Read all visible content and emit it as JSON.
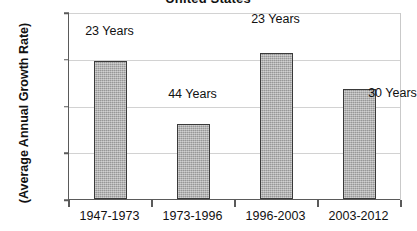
{
  "chart_data": {
    "type": "bar",
    "title": "United States",
    "xlabel": "",
    "ylabel": "(Average Annual Growth Rate)",
    "categories": [
      "1947-1973",
      "1973-1996",
      "1996-2003",
      "2003-2012"
    ],
    "values": [
      2.95,
      1.6,
      3.13,
      2.35
    ],
    "point_labels": [
      "23 Years",
      "44 Years",
      "23 Years",
      "30 Years"
    ],
    "ylim": [
      0,
      4
    ],
    "ytick_labels": [
      "0.0%",
      "1.0%",
      "2.0%",
      "3.0%",
      "4.0%"
    ],
    "ytick_values": [
      0,
      1,
      2,
      3,
      4
    ],
    "grid": true,
    "legend": "none",
    "bar_color": "#a9a9a9",
    "bar_border_color": "#3a3a3a",
    "gridline_color": "#d2d2d2",
    "axis_color": "#5a5a5a",
    "text_color": "#111111",
    "background": "#ffffff"
  }
}
